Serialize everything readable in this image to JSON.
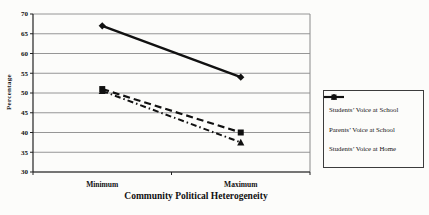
{
  "figure": {
    "kind": "scanned-line-chart"
  },
  "chart_data": {
    "type": "line",
    "title": "",
    "xlabel": "Community Political Heterogeneity",
    "ylabel": "Percentage",
    "categories": [
      "Minimum",
      "Maximum"
    ],
    "series": [
      {
        "name": "Students’ Voice at School",
        "marker": "diamond",
        "line_style": "solid",
        "values": [
          67,
          54
        ]
      },
      {
        "name": "Parents’ Voice at School",
        "marker": "square",
        "line_style": "dash",
        "values": [
          51,
          40
        ]
      },
      {
        "name": "Students’ Voice at Home",
        "marker": "triangle",
        "line_style": "dash-dot",
        "values": [
          50.5,
          37.5
        ]
      }
    ],
    "ylim": [
      30,
      70
    ],
    "ytick_step": 5,
    "yticks": [
      30,
      35,
      40,
      45,
      50,
      55,
      60,
      65,
      70
    ],
    "grid": "horizontal",
    "legend_position": "right",
    "colors": {
      "ink": "#111111",
      "grid": "#8a8a8a",
      "axis": "#222222",
      "background": "#fcfcfa"
    }
  }
}
